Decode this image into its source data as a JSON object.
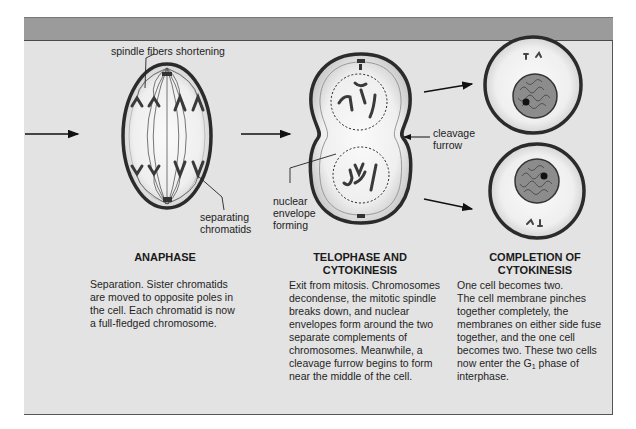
{
  "figure": {
    "labels": {
      "spindle": "spindle fibers shortening",
      "separating": [
        "separating",
        "chromatids"
      ],
      "nuclear": [
        "nuclear",
        "envelope",
        "forming"
      ],
      "cleavage": [
        "cleavage",
        "furrow"
      ]
    },
    "stages": [
      {
        "title": [
          "ANAPHASE"
        ],
        "description": [
          "Separation. Sister chromatids",
          "are moved to opposite poles in",
          "the cell. Each chromatid is now",
          "a full-fledged chromosome."
        ]
      },
      {
        "title": [
          "TELOPHASE AND",
          "CYTOKINESIS"
        ],
        "description": [
          "Exit from mitosis. Chromosomes",
          "decondense, the mitotic spindle",
          "breaks down, and nuclear",
          "envelopes form around the two",
          "separate complements of",
          "chromosomes. Meanwhile, a",
          "cleavage furrow begins to form",
          "near the middle of the cell."
        ]
      },
      {
        "title": [
          "COMPLETION OF",
          "CYTOKINESIS"
        ],
        "description": [
          "One cell becomes two.",
          "The cell membrane pinches",
          "together completely, the",
          "membranes on either side fuse",
          "together, and the one cell",
          "becomes two. These two cells",
          "now enter the G",
          "interphase."
        ],
        "phase_subscript": "1",
        "phase_suffix": " phase of"
      }
    ]
  }
}
